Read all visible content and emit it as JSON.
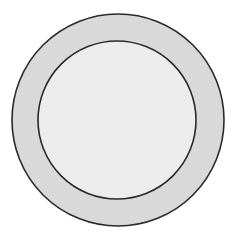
{
  "diagram": {
    "type": "concentric-circles",
    "background": "#ffffff",
    "outer_ring": {
      "cx": 118,
      "cy": 120,
      "r": 106,
      "fill": "#d9d9d9",
      "stroke": "#2a2a2a"
    },
    "inner_circle": {
      "cx": 117,
      "cy": 120,
      "r": 79,
      "fill": "#ececec",
      "stroke": "#2a2a2a"
    }
  }
}
